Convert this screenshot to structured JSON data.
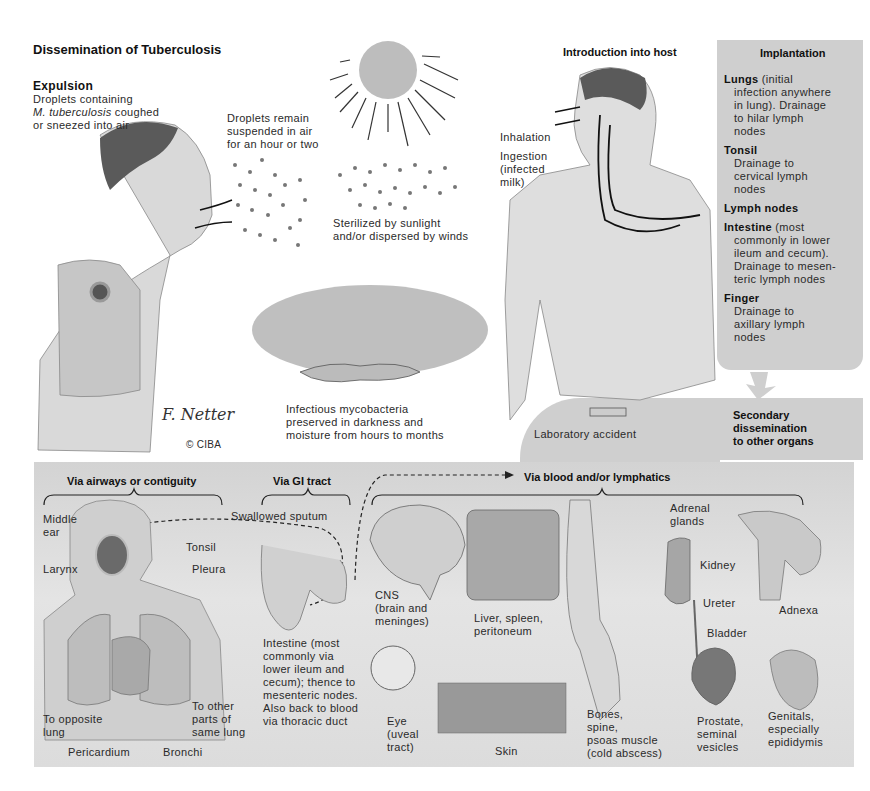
{
  "title": "Dissemination of Tuberculosis",
  "expulsion": {
    "heading": "Expulsion",
    "line1": "Droplets containing",
    "line2_italic": "M. tuberculosis",
    "line2_rest": " coughed",
    "line3": "or sneezed into air"
  },
  "droplets_suspended": [
    "Droplets remain",
    "suspended in air",
    "for an hour or two"
  ],
  "sterilized": [
    "Sterilized by sunlight",
    "and/or dispersed by winds"
  ],
  "infectious": [
    "Infectious mycobacteria",
    "preserved in darkness and",
    "moisture from hours to months"
  ],
  "signature": "© CIBA",
  "introduction": {
    "heading": "Introduction into host",
    "inhalation": "Inhalation",
    "ingestion": [
      "Ingestion",
      "(infected",
      "milk)"
    ],
    "lab_accident": "Laboratory accident"
  },
  "implantation": {
    "heading": "Implantation",
    "items": [
      {
        "name": "Lungs",
        "inline": " (initial",
        "lines": [
          "infection anywhere",
          "in lung). Drainage",
          "to hilar lymph",
          "nodes"
        ]
      },
      {
        "name": "Tonsil",
        "inline": "",
        "lines": [
          "Drainage to",
          "cervical lymph",
          "nodes"
        ]
      },
      {
        "name": "Lymph nodes",
        "inline": "",
        "lines": []
      },
      {
        "name": "Intestine",
        "inline": " (most",
        "lines": [
          "commonly in lower",
          "ileum and cecum).",
          "Drainage to mesen-",
          "teric lymph nodes"
        ]
      },
      {
        "name": "Finger",
        "inline": "",
        "lines": [
          "Drainage to",
          "axillary lymph",
          "nodes"
        ]
      }
    ]
  },
  "secondary": [
    "Secondary",
    "dissemination",
    "to other organs"
  ],
  "routes": {
    "airways": "Via airways or contiguity",
    "gi": "Via GI tract",
    "blood": "Via blood and/or lymphatics"
  },
  "airway_labels": {
    "middle_ear": [
      "Middle",
      "ear"
    ],
    "tonsil": "Tonsil",
    "larynx": "Larynx",
    "pleura": "Pleura",
    "opposite_lung": [
      "To opposite",
      "lung"
    ],
    "same_lung": [
      "To other",
      "parts of",
      "same lung"
    ],
    "pericardium": "Pericardium",
    "bronchi": "Bronchi"
  },
  "gi_labels": {
    "swallowed": "Swallowed sputum",
    "intestine": [
      "Intestine (most",
      "commonly via",
      "lower ileum and",
      "cecum); thence to",
      "mesenteric nodes.",
      "Also back to blood",
      "via thoracic duct"
    ]
  },
  "organs": {
    "cns": [
      "CNS",
      "(brain and",
      "meninges)"
    ],
    "liver": [
      "Liver, spleen,",
      "peritoneum"
    ],
    "eye": [
      "Eye",
      "(uveal",
      "tract)"
    ],
    "skin": "Skin",
    "bones": [
      "Bones,",
      "spine,",
      "psoas muscle",
      "(cold abscess)"
    ],
    "adrenal": [
      "Adrenal",
      "glands"
    ],
    "kidney": "Kidney",
    "ureter": "Ureter",
    "bladder": "Bladder",
    "prostate": [
      "Prostate,",
      "seminal",
      "vesicles"
    ],
    "adnexa": "Adnexa",
    "genitals": [
      "Genitals,",
      "especially",
      "epididymis"
    ]
  },
  "colors": {
    "panel_gray": "#cfcfcf",
    "text": "#1e1e1e",
    "background": "#ffffff"
  }
}
